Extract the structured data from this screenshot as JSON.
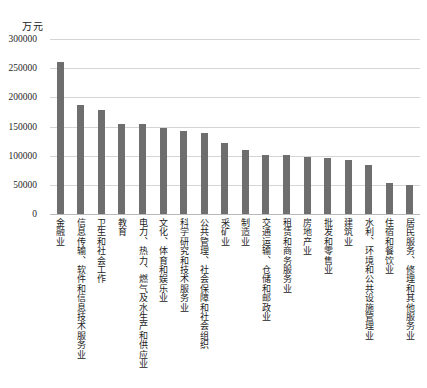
{
  "chart_data": {
    "type": "bar",
    "title": "",
    "subtitle": "",
    "xlabel": "",
    "ylabel": "万元",
    "unit_label": "万元",
    "ylim": [
      0,
      300000
    ],
    "ytick_values": [
      300000,
      250000,
      200000,
      150000,
      100000,
      50000,
      0
    ],
    "ytick_labels": [
      "300000",
      "250000",
      "200000",
      "150000",
      "100000",
      "50000",
      "0"
    ],
    "grid": true,
    "legend": null,
    "legend_position": "none",
    "bar_color": "#6e6e6e",
    "gridline_color": "#d5d5d5",
    "categories": [
      "金融业",
      "信息传输、软件和信息技术服务业",
      "卫生和社会工作",
      "教育",
      "电力、热力、燃气及水生产和供应业",
      "文化、体育和娱乐业",
      "科学研究和技术服务业",
      "公共管理、社会保障和社会组织",
      "采矿业",
      "制造业",
      "交通运输、仓储和邮政业",
      "租赁和商务服务业",
      "房地产业",
      "批发和零售业",
      "建筑业",
      "水利、环境和公共设施管理业",
      "住宿和餐饮业",
      "居民服务、修理和其他服务业"
    ],
    "values": [
      260000,
      187000,
      179000,
      154000,
      154000,
      148000,
      142000,
      139000,
      121000,
      109000,
      101000,
      100500,
      97000,
      96000,
      93000,
      84000,
      53000,
      49000
    ]
  }
}
